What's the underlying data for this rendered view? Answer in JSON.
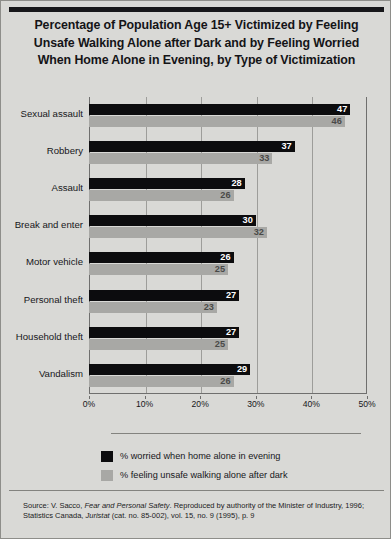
{
  "title": {
    "line1": "Percentage of Population Age 15+ Victimized by Feeling",
    "line2": "Unsafe Walking Alone after Dark and by Feeling Worried",
    "line3": "When Home Alone in Evening, by Type of Victimization"
  },
  "chart_data": {
    "type": "bar",
    "orientation": "horizontal",
    "title": "Percentage of Population Age 15+ Victimized by Feeling Unsafe Walking Alone after Dark and by Feeling Worried When Home Alone in Evening, by Type of Victimization",
    "xlabel": "",
    "ylabel": "",
    "xlim": [
      0,
      50
    ],
    "xticks": [
      0,
      10,
      20,
      30,
      40,
      50
    ],
    "xtick_labels": [
      "0%",
      "10%",
      "20%",
      "30%",
      "40%",
      "50%"
    ],
    "grid": true,
    "legend_position": "bottom-left",
    "categories": [
      "Sexual assault",
      "Robbery",
      "Assault",
      "Break and enter",
      "Motor vehicle",
      "Personal theft",
      "Household theft",
      "Vandalism"
    ],
    "series": [
      {
        "name": "% worried when home alone in evening",
        "color": "#0c0c0e",
        "values": [
          47,
          37,
          28,
          30,
          26,
          27,
          27,
          29
        ]
      },
      {
        "name": "% feeling unsafe walking alone after dark",
        "color": "#a8a8a5",
        "values": [
          46,
          33,
          26,
          32,
          25,
          23,
          25,
          26
        ]
      }
    ]
  },
  "legend": [
    {
      "label": "% worried when home alone in evening",
      "color": "#0c0c0e"
    },
    {
      "label": "% feeling unsafe walking alone after dark",
      "color": "#a8a8a5"
    }
  ],
  "source": {
    "part1": "Source: V. Sacco, ",
    "italic1": "Fear and Personal Safety",
    "part2": ". Reproduced by authority of the Minister of Industry, 1996; Statistics Canada, ",
    "italic2": "Juristat",
    "part3": " (cat. no. 85-002), vol. 15, no. 9 (1995), p. 9"
  }
}
